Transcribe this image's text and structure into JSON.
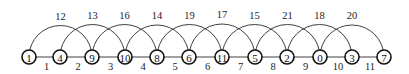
{
  "diagram": {
    "type": "graph-labeling",
    "nodes": [
      {
        "label": "1",
        "x": 29
      },
      {
        "label": "4",
        "x": 60
      },
      {
        "label": "9",
        "x": 92
      },
      {
        "label": "10",
        "x": 125
      },
      {
        "label": "8",
        "x": 157
      },
      {
        "label": "6",
        "x": 189
      },
      {
        "label": "11",
        "x": 222
      },
      {
        "label": "5",
        "x": 255
      },
      {
        "label": "2",
        "x": 287
      },
      {
        "label": "0",
        "x": 320
      },
      {
        "label": "3",
        "x": 352
      },
      {
        "label": "7",
        "x": 384
      }
    ],
    "node_y": 57,
    "node_radius": 7,
    "path_edges": [
      {
        "from": 0,
        "to": 1,
        "label": "1"
      },
      {
        "from": 1,
        "to": 2,
        "label": "2"
      },
      {
        "from": 2,
        "to": 3,
        "label": "3"
      },
      {
        "from": 3,
        "to": 4,
        "label": "4"
      },
      {
        "from": 4,
        "to": 5,
        "label": "5"
      },
      {
        "from": 5,
        "to": 6,
        "label": "6"
      },
      {
        "from": 6,
        "to": 7,
        "label": "7"
      },
      {
        "from": 7,
        "to": 8,
        "label": "8"
      },
      {
        "from": 8,
        "to": 9,
        "label": "9"
      },
      {
        "from": 9,
        "to": 10,
        "label": "10"
      },
      {
        "from": 10,
        "to": 11,
        "label": "11"
      }
    ],
    "arc_edges": [
      {
        "from": 0,
        "to": 2,
        "label": "12"
      },
      {
        "from": 1,
        "to": 3,
        "label": "13"
      },
      {
        "from": 2,
        "to": 4,
        "label": "16"
      },
      {
        "from": 3,
        "to": 5,
        "label": "14"
      },
      {
        "from": 4,
        "to": 6,
        "label": "19"
      },
      {
        "from": 5,
        "to": 7,
        "label": "17"
      },
      {
        "from": 6,
        "to": 8,
        "label": "15"
      },
      {
        "from": 7,
        "to": 9,
        "label": "21"
      },
      {
        "from": 8,
        "to": 10,
        "label": "18"
      },
      {
        "from": 9,
        "to": 11,
        "label": "20"
      }
    ]
  }
}
